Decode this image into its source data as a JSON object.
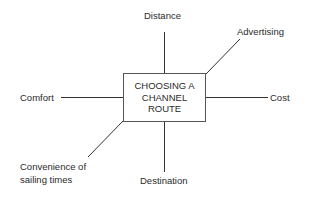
{
  "diagram": {
    "center": {
      "label": "CHOOSING A\nCHANNEL\nROUTE"
    },
    "factors": {
      "top": "Distance",
      "top_right": "Advertising",
      "left": "Comfort",
      "right": "Cost",
      "bottom_left_line1": "Convenience of",
      "bottom_left_line2": "sailing times",
      "bottom": "Destination"
    },
    "colors": {
      "line": "#333333",
      "text": "#2a2a2a",
      "background": "#ffffff"
    }
  }
}
